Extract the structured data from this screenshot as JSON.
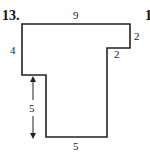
{
  "problem": {
    "number": "13.",
    "next_number_fragment": "1"
  },
  "shape": {
    "type": "rectilinear polygon",
    "stroke_color": "#222222",
    "labels": {
      "top": "9",
      "right_upper": "2",
      "step_horizontal": "2",
      "left_upper": "4",
      "left_lower_arrow": "5",
      "bottom": "5"
    }
  }
}
